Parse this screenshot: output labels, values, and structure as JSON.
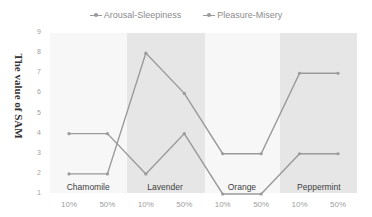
{
  "chart_data": {
    "type": "line",
    "title": "",
    "xlabel": "",
    "ylabel": "The value of SAM",
    "ylim": [
      1,
      9
    ],
    "yticks": [
      "1",
      "2",
      "3",
      "4",
      "5",
      "6",
      "7",
      "8",
      "9"
    ],
    "categories": [
      "10%",
      "50%",
      "10%",
      "50%",
      "10%",
      "50%",
      "10%",
      "50%"
    ],
    "groups": [
      {
        "name": "Chamomile",
        "shaded": false
      },
      {
        "name": "Lavender",
        "shaded": true
      },
      {
        "name": "Orange",
        "shaded": false
      },
      {
        "name": "Peppermint",
        "shaded": true
      }
    ],
    "series": [
      {
        "name": "Arousal-Sleepiness",
        "values": [
          2,
          2,
          8,
          6,
          3,
          3,
          7,
          7
        ]
      },
      {
        "name": "Pleasure-Misery",
        "values": [
          4,
          4,
          2,
          4,
          1,
          1,
          3,
          3
        ]
      }
    ],
    "grid": false,
    "legend_position": "top",
    "colors": {
      "line": "#9a9a9a",
      "shade_dark": "#e6e6e6",
      "shade_light": "#efefef"
    }
  }
}
